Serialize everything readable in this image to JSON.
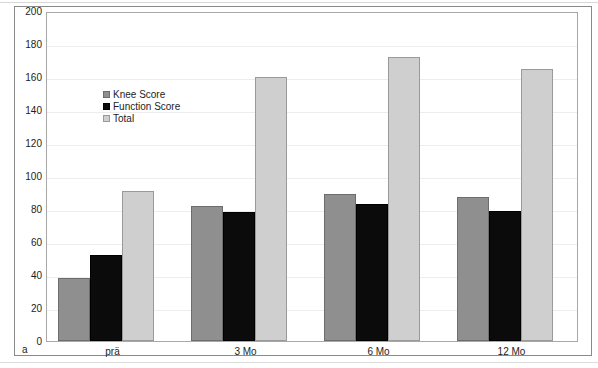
{
  "figure": {
    "panel_letter": "a"
  },
  "chart_data": {
    "type": "bar",
    "title": "",
    "xlabel": "",
    "ylabel": "",
    "ylim": [
      0,
      200
    ],
    "ytick_step": 20,
    "yticks": [
      200,
      180,
      160,
      140,
      120,
      100,
      80,
      60,
      40,
      20,
      0
    ],
    "grid": true,
    "grid_axis": "y",
    "legend_position": "upper-left-inside",
    "categories": [
      "prä",
      "3 Mo",
      "6 Mo",
      "12 Mo"
    ],
    "series": [
      {
        "name": "Knee Score",
        "color": "#8f8f8f",
        "values": [
          38,
          82,
          89,
          87
        ]
      },
      {
        "name": "Function Score",
        "color": "#0b0b0b",
        "values": [
          52,
          78,
          83,
          79
        ]
      },
      {
        "name": "Total",
        "color": "#cfcfcf",
        "values": [
          91,
          160,
          172,
          165
        ]
      }
    ]
  }
}
